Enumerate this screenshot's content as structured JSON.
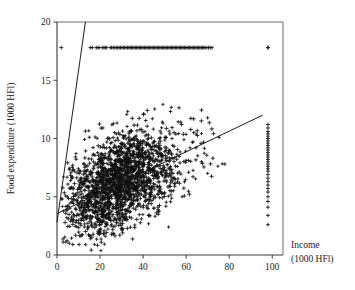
{
  "chart_data": {
    "type": "scatter",
    "title": "",
    "xlabel": "Income",
    "xlabel_units": "(1000 HFl)",
    "ylabel": "Food expenditure (1000 HFl)",
    "xlim": [
      0,
      105
    ],
    "ylim": [
      0,
      20
    ],
    "xticks": [
      0,
      20,
      40,
      60,
      80,
      100
    ],
    "xticklabels": [
      "0",
      "20",
      "40",
      "60",
      "80",
      "100"
    ],
    "yticks": [
      0,
      5,
      10,
      15,
      20
    ],
    "yticklabels": [
      "0",
      "5",
      "10",
      "15",
      "20"
    ],
    "grid": false,
    "legend": "none",
    "marker": "plus",
    "marker_color": "#111111",
    "line_color": "#1c1c1c",
    "annotations": [
      "Horizontal band of censored observations at food expenditure = 17.8",
      "Vertical band of censored observations at income = 98",
      "Two fitted regression lines overlaid on the point cloud"
    ],
    "lines": [
      {
        "name": "steep-fit-line",
        "x": [
          0.0,
          13.2
        ],
        "y": [
          2.8,
          20.0
        ]
      },
      {
        "name": "shallow-fit-line",
        "x": [
          0.0,
          95.5
        ],
        "y": [
          3.55,
          12.0
        ]
      }
    ],
    "censored_horizontal": {
      "y": 17.8,
      "x": [
        2.0,
        15.5,
        16.4,
        18.2,
        19.0,
        19.6,
        21.0,
        21.8,
        22.4,
        23.1,
        24.8,
        25.4,
        26.1,
        26.8,
        27.5,
        28.2,
        28.9,
        29.5,
        30.2,
        30.9,
        31.5,
        32.1,
        32.8,
        33.4,
        34.0,
        34.6,
        35.2,
        35.8,
        36.4,
        37.0,
        37.6,
        38.2,
        38.8,
        39.4,
        40.0,
        40.6,
        41.2,
        41.8,
        42.4,
        43.0,
        43.6,
        44.2,
        44.8,
        45.4,
        46.0,
        46.6,
        47.2,
        47.8,
        48.4,
        49.0,
        49.6,
        50.2,
        50.8,
        51.4,
        52.0,
        52.6,
        53.2,
        53.8,
        54.4,
        55.0,
        55.6,
        56.2,
        56.8,
        57.4,
        58.0,
        58.6,
        59.2,
        59.8,
        60.4,
        61.0,
        61.6,
        62.2,
        62.8,
        63.4,
        64.0,
        64.6,
        65.2,
        65.8,
        66.4,
        67.0,
        67.6,
        68.2,
        68.8,
        69.6,
        70.4,
        71.2,
        72.0,
        98.0
      ]
    },
    "censored_vertical": {
      "x": 98.0,
      "y": [
        2.6,
        3.4,
        4.1,
        4.6,
        5.0,
        5.4,
        5.7,
        6.0,
        6.3,
        6.6,
        6.9,
        7.2,
        7.4,
        7.6,
        7.8,
        8.0,
        8.2,
        8.4,
        8.6,
        8.8,
        9.0,
        9.2,
        9.4,
        9.6,
        9.8,
        10.0,
        10.2,
        10.4,
        10.6,
        10.9,
        11.2,
        17.8
      ]
    },
    "cloud": {
      "description": "Dense cloud of household observations",
      "n_points": 2100,
      "x_center": 29.0,
      "y_center": 6.3,
      "x_spread": 12.5,
      "y_spread": 2.25,
      "correlation": 0.45,
      "x_min": 2.0,
      "x_max": 80.0,
      "y_min": 0.2,
      "y_max": 13.2
    }
  }
}
